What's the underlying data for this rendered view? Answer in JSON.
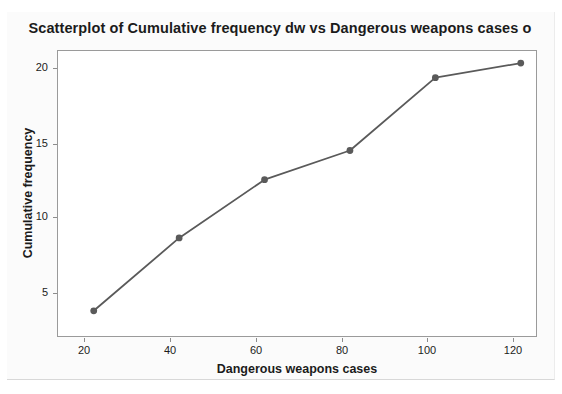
{
  "chart_data": {
    "type": "line",
    "title": "Scatterplot of Cumulative frequency dw vs Dangerous weapons cases o",
    "xlabel": "Dangerous weapons cases",
    "ylabel": "Cumulative frequency",
    "x": [
      20,
      40,
      60,
      80,
      100,
      120
    ],
    "values": [
      3,
      8,
      12,
      14,
      19,
      20
    ],
    "series": [
      {
        "name": "Cumulative frequency dw",
        "x": [
          20,
          40,
          60,
          80,
          100,
          120
        ],
        "values": [
          3,
          8,
          12,
          14,
          19,
          20
        ]
      }
    ],
    "xticks": [
      "20",
      "40",
      "60",
      "80",
      "100",
      "120"
    ],
    "yticks": [
      "5",
      "10",
      "15",
      "20"
    ],
    "xtick_values": [
      20,
      40,
      60,
      80,
      100,
      120
    ],
    "ytick_values": [
      5,
      10,
      15,
      20
    ],
    "xlim": [
      11.4,
      123.8
    ],
    "ylim": [
      1.2,
      20.9
    ],
    "grid": false,
    "legend": "none",
    "marker": "filled-circle",
    "line_color": "#5a5a5a",
    "marker_color": "#5a5a5a",
    "frame_color": "#9a9a9a",
    "background": "#ffffff"
  }
}
